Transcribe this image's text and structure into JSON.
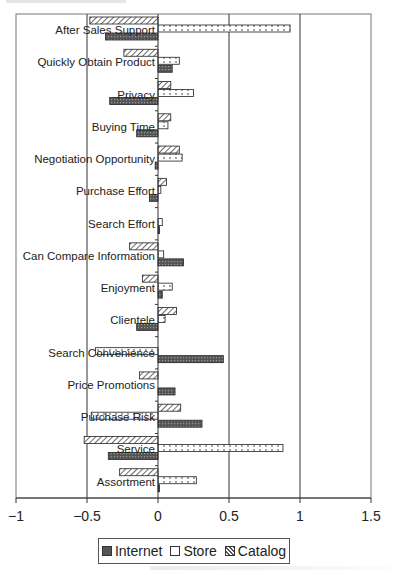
{
  "chart_data": {
    "type": "bar",
    "orientation": "horizontal",
    "title": "",
    "xlabel": "",
    "ylabel": "",
    "xlim": [
      -1,
      1.5
    ],
    "x_ticks": [
      -1,
      -0.5,
      0,
      0.5,
      1,
      1.5
    ],
    "x_tick_labels": [
      "−1",
      "−0.5",
      "0",
      "0.5",
      "1",
      "1.5"
    ],
    "grid": "vertical lines at major ticks",
    "legend_position": "bottom",
    "categories": [
      "After Sales Support",
      "Quickly Obtain Product",
      "Privacy",
      "Buying Time",
      "Negotiation Opportunity",
      "Purchase Effort",
      "Search Effort",
      "Can Compare Information",
      "Enjoyment",
      "Clientele",
      "Search Convenience",
      "Price Promotions",
      "Purchase Risk",
      "Service",
      "Assortment"
    ],
    "series": [
      {
        "name": "Catalog",
        "pattern": "diagonal-hatch",
        "values": [
          -0.48,
          -0.24,
          0.09,
          0.09,
          0.15,
          0.06,
          0.0,
          -0.2,
          -0.11,
          0.13,
          0.0,
          -0.13,
          0.16,
          -0.52,
          -0.27
        ]
      },
      {
        "name": "Store",
        "pattern": "dotted-light",
        "values": [
          0.93,
          0.15,
          0.25,
          0.07,
          0.17,
          0.02,
          0.03,
          0.04,
          0.1,
          0.05,
          -0.44,
          0.0,
          -0.47,
          0.88,
          0.27
        ]
      },
      {
        "name": "Internet",
        "pattern": "dark-crosshatch",
        "values": [
          -0.37,
          0.1,
          -0.34,
          -0.15,
          -0.02,
          -0.06,
          0.01,
          0.18,
          0.03,
          -0.15,
          0.46,
          0.12,
          0.31,
          -0.35,
          0.01
        ]
      }
    ]
  },
  "legend": {
    "items": [
      {
        "label": "Internet",
        "pattern": "dark-crosshatch"
      },
      {
        "label": "Store",
        "pattern": "dotted-light"
      },
      {
        "label": "Catalog",
        "pattern": "diagonal-hatch"
      }
    ]
  }
}
